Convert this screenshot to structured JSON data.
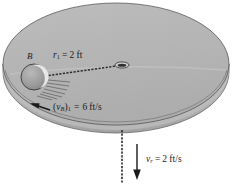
{
  "figure": {
    "colors": {
      "disk_fill": "#b5b5b5",
      "disk_fill_light": "#c2c2c2",
      "disk_rim": "#aaaaaa",
      "outline": "#4a4a4a",
      "ink": "#1a1a1a",
      "background": "#ffffff",
      "ball_fill": "#9a9a9a",
      "ball_highlight": "#e8e8e8"
    },
    "labels": {
      "ball": {
        "symbol": "B"
      },
      "radius": {
        "symbol": "r",
        "subscript": "1",
        "equals": "=",
        "value": "2",
        "units": "ft"
      },
      "tangential_velocity": {
        "open": "(",
        "symbol": "v",
        "subscript": "B",
        "close": ")",
        "subscript2": "1",
        "equals": "=",
        "value": "6",
        "units": "ft/s"
      },
      "radial_velocity": {
        "symbol": "v",
        "subscript": "r",
        "equals": "=",
        "value": "2",
        "units": "ft/s"
      }
    },
    "elements": {
      "disk": "rotating circular platform shown in perspective as an ellipse with rim thickness",
      "ball": "ball B resting on the disk surface",
      "cord": "dashed cord from ball B through a central eyelet hole in the disk",
      "hole": "small eyelet at disk center",
      "hanging_cord": "dashed cord hanging vertically below the disk center",
      "tangential_arrow": "arrow pointing left-and-up indicating ball tangential velocity",
      "radial_arrow": "arrow pointing straight down indicating cord pull velocity",
      "hatching": "short hatch lines beneath the ball"
    }
  }
}
